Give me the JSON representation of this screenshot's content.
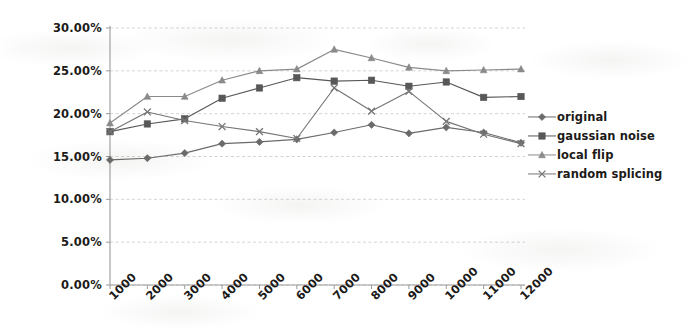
{
  "chart_data": {
    "type": "line",
    "title": "",
    "xlabel": "",
    "ylabel": "",
    "grid": true,
    "legend_position": "right",
    "x": [
      1000,
      2000,
      3000,
      4000,
      5000,
      6000,
      7000,
      8000,
      9000,
      10000,
      11000,
      12000
    ],
    "categories": [
      "1000",
      "2000",
      "3000",
      "4000",
      "5000",
      "6000",
      "7000",
      "8000",
      "9000",
      "10000",
      "11000",
      "12000"
    ],
    "xlim": [
      1000,
      12000
    ],
    "ylim": [
      0.0,
      30.0
    ],
    "y_ticks": [
      0.0,
      5.0,
      10.0,
      15.0,
      20.0,
      25.0,
      30.0
    ],
    "y_tick_labels": [
      "0.00%",
      "5.00%",
      "10.00%",
      "15.00%",
      "20.00%",
      "25.00%",
      "30.00%"
    ],
    "value_unit": "%",
    "series": [
      {
        "name": "original",
        "marker": "diamond",
        "color": "#6b6b6b",
        "values": [
          14.6,
          14.8,
          15.4,
          16.5,
          16.7,
          17.0,
          17.8,
          18.7,
          17.7,
          18.4,
          17.8,
          16.6
        ]
      },
      {
        "name": "gaussian noise",
        "marker": "square",
        "color": "#585858",
        "values": [
          17.9,
          18.8,
          19.4,
          21.8,
          23.0,
          24.2,
          23.8,
          23.9,
          23.2,
          23.7,
          21.9,
          22.0
        ]
      },
      {
        "name": "local flip",
        "marker": "triangle",
        "color": "#8a8a8a",
        "values": [
          18.9,
          22.0,
          22.0,
          23.9,
          25.0,
          25.2,
          27.5,
          26.5,
          25.4,
          25.0,
          25.1,
          25.2
        ]
      },
      {
        "name": "random splicing",
        "marker": "cross",
        "color": "#757575",
        "values": [
          17.9,
          20.2,
          19.2,
          18.5,
          17.9,
          17.1,
          23.0,
          20.3,
          22.6,
          19.1,
          17.6,
          16.5
        ]
      }
    ]
  },
  "legend": {
    "items": [
      {
        "label": "original",
        "marker": "diamond"
      },
      {
        "label": "gaussian noise",
        "marker": "square"
      },
      {
        "label": "local flip",
        "marker": "triangle"
      },
      {
        "label": "random splicing",
        "marker": "cross"
      }
    ]
  },
  "colors": {
    "axis": "#9a9a9a",
    "grid": "#c9c9c9",
    "text": "#1c1a18",
    "background": "#ffffff"
  }
}
